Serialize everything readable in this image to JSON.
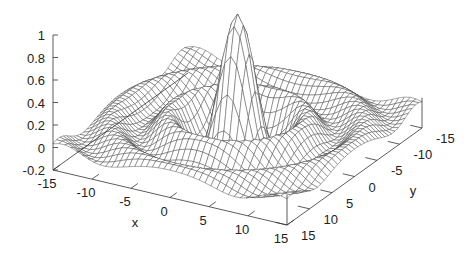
{
  "chart_data": {
    "type": "surface3d",
    "title": "",
    "function": "sin(sqrt(x^2+y^2))/sqrt(x^2+y^2)",
    "xlabel": "x",
    "ylabel": "y",
    "zlabel": "",
    "xlim": [
      -15,
      15
    ],
    "ylim": [
      -15,
      15
    ],
    "zlim": [
      -0.2,
      1
    ],
    "x_ticks": [
      "-15",
      "-10",
      "-5",
      "0",
      "5",
      "10",
      "15"
    ],
    "y_ticks": [
      "15",
      "10",
      "5",
      "0",
      "-5",
      "-10",
      "-15"
    ],
    "z_ticks": [
      "1",
      "0.8",
      "0.6",
      "0.4",
      "0.2",
      "0",
      "-0.2"
    ],
    "grid_samples": 40,
    "line_color": "#444444",
    "legend": "none"
  }
}
